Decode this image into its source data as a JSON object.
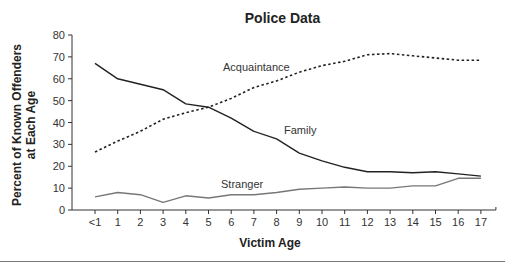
{
  "chart_data": {
    "type": "line",
    "title": "Police Data",
    "xlabel": "Victim Age",
    "ylabel": "Percent of Known Offenders at Each Age",
    "ylabel_lines": [
      "Percent of Known Offenders",
      "at Each Age"
    ],
    "categories": [
      "<1",
      "1",
      "2",
      "3",
      "4",
      "5",
      "6",
      "7",
      "8",
      "9",
      "10",
      "11",
      "12",
      "13",
      "14",
      "15",
      "16",
      "17"
    ],
    "ylim": [
      0,
      80
    ],
    "yticks": [
      0,
      10,
      20,
      30,
      40,
      50,
      60,
      70,
      80
    ],
    "grid": false,
    "legend": "inline labels",
    "series": [
      {
        "name": "Family",
        "style": "solid",
        "color": "#222222",
        "values": [
          67,
          60,
          57.5,
          55,
          48.5,
          47,
          42,
          36,
          32.5,
          26,
          22.5,
          19.5,
          17.5,
          17.5,
          17,
          17.5,
          16.5,
          15.5
        ]
      },
      {
        "name": "Acquaintance",
        "style": "dotted",
        "color": "#222222",
        "values": [
          26.5,
          31.5,
          36,
          41.5,
          44.5,
          47,
          51,
          56,
          59,
          63,
          66,
          68,
          71,
          71.5,
          70.5,
          69.5,
          68.5,
          68.5
        ]
      },
      {
        "name": "Stranger",
        "style": "solid",
        "color": "#777777",
        "values": [
          6,
          8,
          7,
          3.5,
          6.5,
          5.5,
          7,
          7,
          8,
          9.5,
          10,
          10.5,
          10,
          10,
          11,
          11,
          14.5,
          14.5
        ]
      }
    ],
    "annotations": [
      {
        "text": "Acquaintance",
        "series": "Acquaintance"
      },
      {
        "text": "Family",
        "series": "Family"
      },
      {
        "text": "Stranger",
        "series": "Stranger"
      }
    ]
  }
}
